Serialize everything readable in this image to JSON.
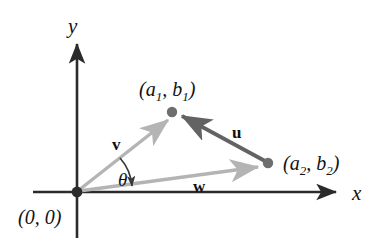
{
  "figure": {
    "background_color": "#ffffff",
    "axes": {
      "x_label": "x",
      "y_label": "y",
      "axis_color": "#2b2b2b",
      "origin_label": "(0, 0)"
    },
    "points": [
      {
        "name": "origin",
        "label": "(0, 0)",
        "x": 77,
        "y": 192,
        "dot_color": "#2b2b2b",
        "dot_radius": 5
      },
      {
        "name": "point-a1b1",
        "label_open": "(",
        "label_a": "a",
        "label_a_sub": "1",
        "label_comma": ", ",
        "label_b": "b",
        "label_b_sub": "1",
        "label_close": ")",
        "x": 172,
        "y": 112,
        "dot_color": "#6e6e6e",
        "dot_radius": 5
      },
      {
        "name": "point-a2b2",
        "label_open": "(",
        "label_a": "a",
        "label_a_sub": "2",
        "label_comma": ", ",
        "label_b": "b",
        "label_b_sub": "2",
        "label_close": ")",
        "x": 268,
        "y": 163,
        "dot_color": "#6e6e6e",
        "dot_radius": 5
      }
    ],
    "vectors": [
      {
        "name": "vector-v",
        "label": "v",
        "from": "origin",
        "to": "point-a1b1",
        "color": "#b4b4b4",
        "label_x": 117,
        "label_y": 144
      },
      {
        "name": "vector-w",
        "label": "w",
        "from": "origin",
        "to": "point-a2b2",
        "color": "#b4b4b4",
        "label_x": 197,
        "label_y": 186
      },
      {
        "name": "vector-u",
        "label": "u",
        "from": "point-a2b2",
        "to": "point-a1b1",
        "color": "#636363",
        "label_x": 236,
        "label_y": 132
      }
    ],
    "angle": {
      "name": "angle-theta",
      "label": "θ",
      "between": [
        "vector-v",
        "vector-w"
      ],
      "label_x": 123,
      "label_y": 180,
      "arc_color": "#3a3a3a"
    }
  }
}
